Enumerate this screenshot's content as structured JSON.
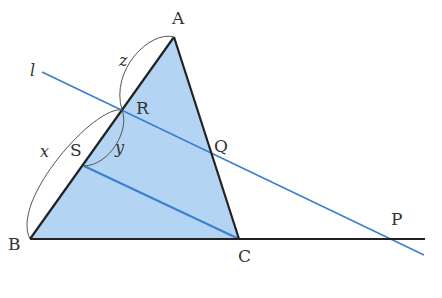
{
  "diagram": {
    "colors": {
      "fill": "#b3d4f3",
      "blue_line": "#3b7fd0",
      "black": "#222222",
      "arc": "#555555"
    },
    "points": {
      "A": {
        "label": "A",
        "x": 174,
        "y": 37
      },
      "B": {
        "label": "B",
        "x": 30,
        "y": 239
      },
      "C": {
        "label": "C",
        "x": 239,
        "y": 239
      },
      "R": {
        "label": "R",
        "x": 122,
        "y": 110
      },
      "S": {
        "label": "S",
        "x": 84,
        "y": 166
      },
      "Q": {
        "label": "Q",
        "x": 211,
        "y": 149
      },
      "P": {
        "label": "P",
        "x": 392,
        "y": 239
      }
    },
    "line_label": "l",
    "segment_labels": {
      "x": "x",
      "y": "y",
      "z": "z"
    }
  }
}
